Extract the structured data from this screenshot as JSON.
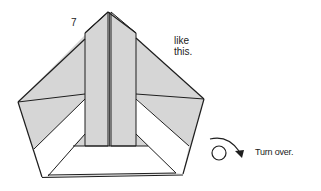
{
  "diagram": {
    "step_number": "7",
    "note_line1": "like",
    "note_line2": "this.",
    "turn_over_label": "Turn over.",
    "colors": {
      "paper_shaded": "#d6d6d6",
      "paper_white": "#ffffff",
      "line": "#1e1e1e"
    }
  }
}
